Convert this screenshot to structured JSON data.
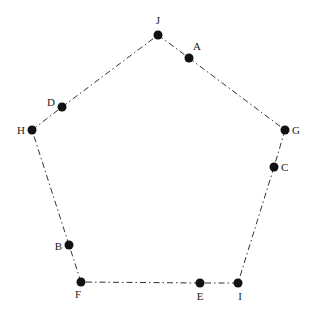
{
  "header": {
    "cutoff_text": ""
  },
  "diagram": {
    "type": "pentagon-graph",
    "line_style": "dash-dot",
    "nodes": [
      {
        "id": "J",
        "label": "J",
        "x": 158,
        "y": 35,
        "lx": 158,
        "ly": 24,
        "anchor": "middle"
      },
      {
        "id": "A",
        "label": "A",
        "x": 189,
        "y": 58,
        "lx": 197,
        "ly": 50,
        "anchor": "middle"
      },
      {
        "id": "G",
        "label": "G",
        "x": 285,
        "y": 130,
        "lx": 292,
        "ly": 134,
        "anchor": "start"
      },
      {
        "id": "C",
        "label": "C",
        "x": 274,
        "y": 167,
        "lx": 281,
        "ly": 171,
        "anchor": "start"
      },
      {
        "id": "I",
        "label": "I",
        "x": 238,
        "y": 283,
        "lx": 240,
        "ly": 300,
        "anchor": "middle"
      },
      {
        "id": "E",
        "label": "E",
        "x": 200,
        "y": 283,
        "lx": 200,
        "ly": 300,
        "anchor": "middle"
      },
      {
        "id": "F",
        "label": "F",
        "x": 81,
        "y": 282,
        "lx": 78,
        "ly": 298,
        "anchor": "middle"
      },
      {
        "id": "B",
        "label": "B",
        "x": 69,
        "y": 245,
        "lx": 62,
        "ly": 250,
        "anchor": "end"
      },
      {
        "id": "H",
        "label": "H",
        "x": 32,
        "y": 130,
        "lx": 25,
        "ly": 134,
        "anchor": "end"
      },
      {
        "id": "D",
        "label": "D",
        "x": 62,
        "y": 107,
        "lx": 55,
        "ly": 106,
        "anchor": "end"
      }
    ],
    "edges": [
      [
        "J",
        "A"
      ],
      [
        "A",
        "G"
      ],
      [
        "G",
        "C"
      ],
      [
        "C",
        "I"
      ],
      [
        "I",
        "E"
      ],
      [
        "E",
        "F"
      ],
      [
        "F",
        "B"
      ],
      [
        "B",
        "H"
      ],
      [
        "H",
        "D"
      ],
      [
        "D",
        "J"
      ]
    ]
  }
}
